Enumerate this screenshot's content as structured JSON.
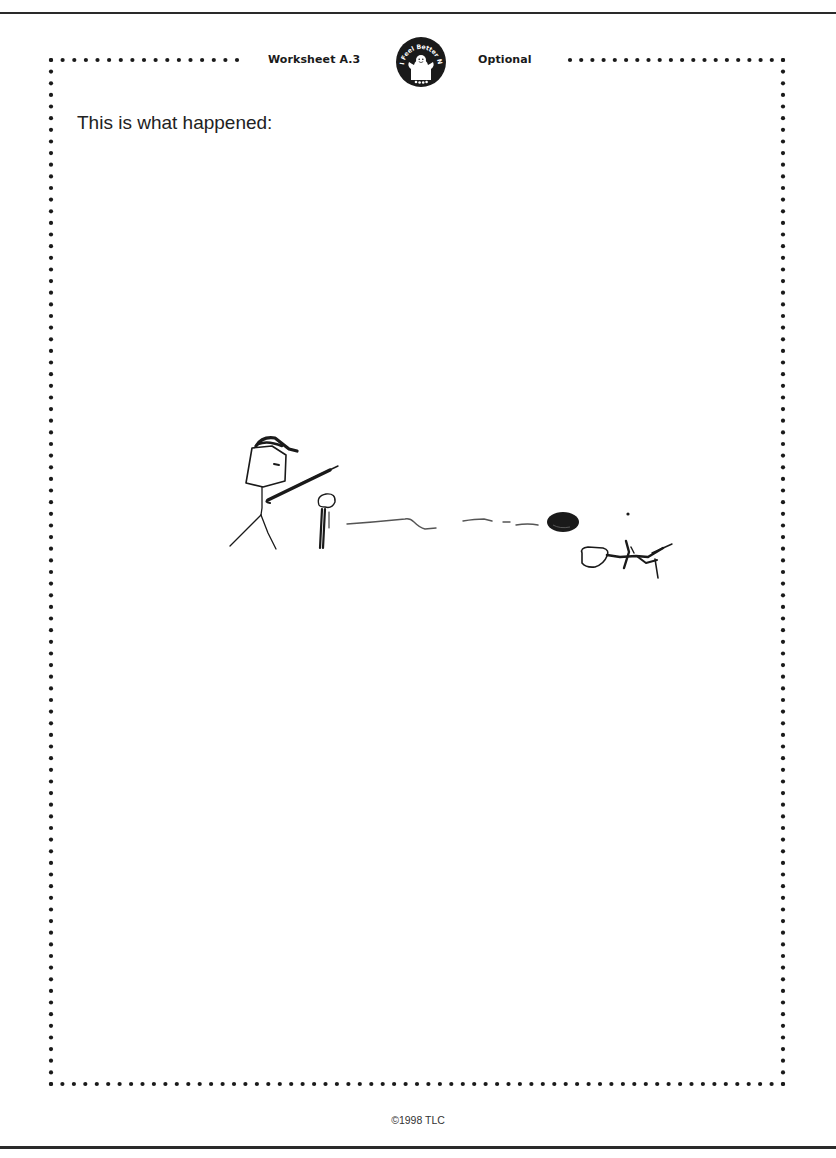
{
  "header": {
    "worksheet_label": "Worksheet A.3",
    "optional_label": "Optional",
    "logo": {
      "icon": "ghost-badge-icon",
      "text": "I Feel Better Now!"
    }
  },
  "main": {
    "prompt": "This is what happened:",
    "drawing": {
      "description": "Child's hand drawing: stick figure with cap swinging a bat at a ball on a tee; dashed line showing ball trajectory toward a dark ball; a small creature/dog figure to the right",
      "icons": [
        "stick-figure-icon",
        "bat-icon",
        "tee-icon",
        "ball-trajectory-icon",
        "ball-icon",
        "dog-icon"
      ]
    }
  },
  "footer": {
    "copyright": "©1998 TLC"
  },
  "colors": {
    "ink": "#1a1a1a",
    "paper": "#ffffff"
  }
}
